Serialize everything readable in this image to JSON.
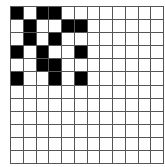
{
  "grid": {
    "rows": 12,
    "cols": 12,
    "filled_color": "#000000",
    "empty_color": "#ffffff",
    "line_color": "#555555",
    "filled_cells": [
      [
        0,
        0
      ],
      [
        0,
        2
      ],
      [
        0,
        3
      ],
      [
        1,
        1
      ],
      [
        1,
        4
      ],
      [
        1,
        5
      ],
      [
        2,
        1
      ],
      [
        2,
        3
      ],
      [
        3,
        0
      ],
      [
        3,
        2
      ],
      [
        3,
        5
      ],
      [
        4,
        2
      ],
      [
        4,
        3
      ],
      [
        5,
        0
      ],
      [
        5,
        3
      ],
      [
        5,
        5
      ]
    ]
  }
}
